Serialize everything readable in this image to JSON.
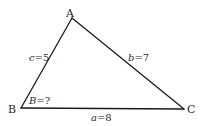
{
  "diagram": {
    "type": "triangle",
    "stroke_color": "#1a1a1a",
    "vertices": {
      "A": {
        "label": "A",
        "x": 72,
        "y": 18
      },
      "B": {
        "label": "B",
        "x": 21,
        "y": 108
      },
      "C": {
        "label": "C",
        "x": 184,
        "y": 109
      }
    },
    "sides": {
      "a": {
        "var": "a",
        "eq": "=8",
        "between": [
          "B",
          "C"
        ],
        "value": 8
      },
      "b": {
        "var": "b",
        "eq": "=7",
        "between": [
          "A",
          "C"
        ],
        "value": 7
      },
      "c": {
        "var": "c",
        "eq": "=5",
        "between": [
          "A",
          "B"
        ],
        "value": 5
      }
    },
    "angle": {
      "vertex": "B",
      "var": "B",
      "eq": "=?"
    }
  }
}
